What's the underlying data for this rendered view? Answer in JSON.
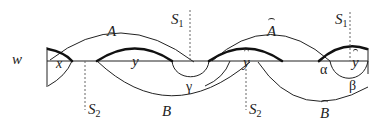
{
  "diagram": {
    "labels": {
      "w": "w",
      "x": "x",
      "y": "y",
      "y_hat_mid": "y",
      "y_hat_right": "y",
      "A": "A",
      "A_hat": "A",
      "B": "B",
      "B_hat": "B",
      "S1_left": "S",
      "S1_left_sub": "1",
      "S1_right": "S",
      "S1_right_sub": "1",
      "S2_left": "S",
      "S2_left_sub": "2",
      "S2_right": "S",
      "S2_right_sub": "2",
      "alpha": "α",
      "beta": "β",
      "gamma": "γ"
    },
    "colors": {
      "stroke": "#222222",
      "dashed": "#555555",
      "background": "#ffffff"
    }
  }
}
